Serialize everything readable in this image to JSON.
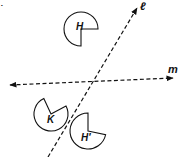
{
  "figure": {
    "lines": [
      {
        "name": "line-l",
        "label": "ℓ",
        "from": [
          48,
          157
        ],
        "to": [
          137,
          8
        ],
        "arrow_ends": [
          "end"
        ],
        "label_pos": [
          140,
          10
        ]
      },
      {
        "name": "line-m",
        "label": "m",
        "from": [
          10,
          85
        ],
        "to": [
          173,
          78
        ],
        "arrow_ends": [
          "start",
          "end"
        ],
        "label_pos": [
          168,
          73
        ]
      }
    ],
    "shapes": [
      {
        "name": "shape-h",
        "label": "H",
        "center": [
          81,
          29
        ],
        "r": 17,
        "notch_from_deg": 0,
        "notch_to_deg": 90,
        "label_pos": [
          76,
          30
        ]
      },
      {
        "name": "shape-k",
        "label": "K",
        "center": [
          51,
          114
        ],
        "r": 17,
        "notch_from_deg": -115,
        "notch_to_deg": -28,
        "label_pos": [
          47,
          123
        ]
      },
      {
        "name": "shape-h-prime",
        "label": "H′",
        "center": [
          88,
          131
        ],
        "r": 18,
        "notch_from_deg": -90,
        "notch_to_deg": 12,
        "label_pos": [
          81,
          141
        ]
      }
    ],
    "corner_mark": "."
  }
}
